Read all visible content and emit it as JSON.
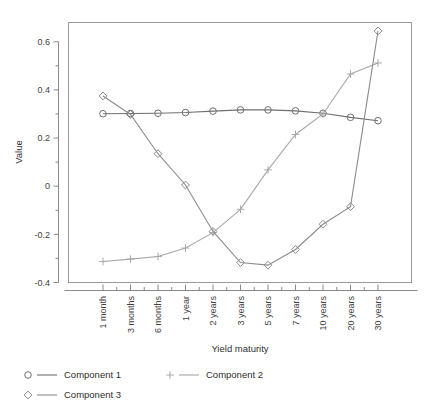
{
  "chart_data": {
    "type": "line",
    "title": "",
    "xlabel": "Yield maturity",
    "ylabel": "Value",
    "categories": [
      "1 month",
      "3 months",
      "6 months",
      "1 year",
      "2 years",
      "3 years",
      "5 years",
      "7 years",
      "10 years",
      "20 years",
      "30 years"
    ],
    "ylim": [
      -0.4,
      0.68
    ],
    "yticks": [
      -0.4,
      -0.2,
      0,
      0.2,
      0.4,
      0.6
    ],
    "yticklabels": [
      "-0.4",
      "-0.2",
      "0",
      "0.2",
      "0.4",
      "0.6"
    ],
    "grid": false,
    "legend_position": "bottom",
    "series": [
      {
        "name": "Component 1",
        "marker": "circle",
        "color": "#707070",
        "values": [
          0.301,
          0.302,
          0.303,
          0.306,
          0.312,
          0.317,
          0.317,
          0.313,
          0.303,
          0.286,
          0.272
        ]
      },
      {
        "name": "Component 2",
        "marker": "plus",
        "color": "#a8a8a8",
        "values": [
          -0.313,
          -0.303,
          -0.292,
          -0.257,
          -0.193,
          -0.096,
          0.068,
          0.215,
          0.3,
          0.466,
          0.512
        ]
      },
      {
        "name": "Component 3",
        "marker": "diamond",
        "color": "#8c8c8c",
        "values": [
          0.375,
          0.298,
          0.135,
          0.005,
          -0.188,
          -0.317,
          -0.328,
          -0.263,
          -0.158,
          -0.085,
          0.645
        ]
      }
    ]
  },
  "axes": {
    "ylabel": "Value",
    "xlabel": "Yield maturity",
    "ytick_labels": [
      "0.6",
      "0.4",
      "0.2",
      "0",
      "-0.2",
      "-0.4"
    ],
    "xtick_labels": [
      "1 month",
      "3 months",
      "6 months",
      "1 year",
      "2 years",
      "3 years",
      "5 years",
      "7 years",
      "10 years",
      "20 years",
      "30 years"
    ]
  },
  "legend": {
    "entries": [
      {
        "label": "Component 1",
        "marker": "circle-icon"
      },
      {
        "label": "Component 2",
        "marker": "plus-icon"
      },
      {
        "label": "Component 3",
        "marker": "diamond-icon"
      }
    ]
  },
  "colors": {
    "component_1": "#707070",
    "component_2": "#a8a8a8",
    "component_3": "#8c8c8c",
    "axis": "#8a8a8a",
    "background": "#ffffff"
  }
}
